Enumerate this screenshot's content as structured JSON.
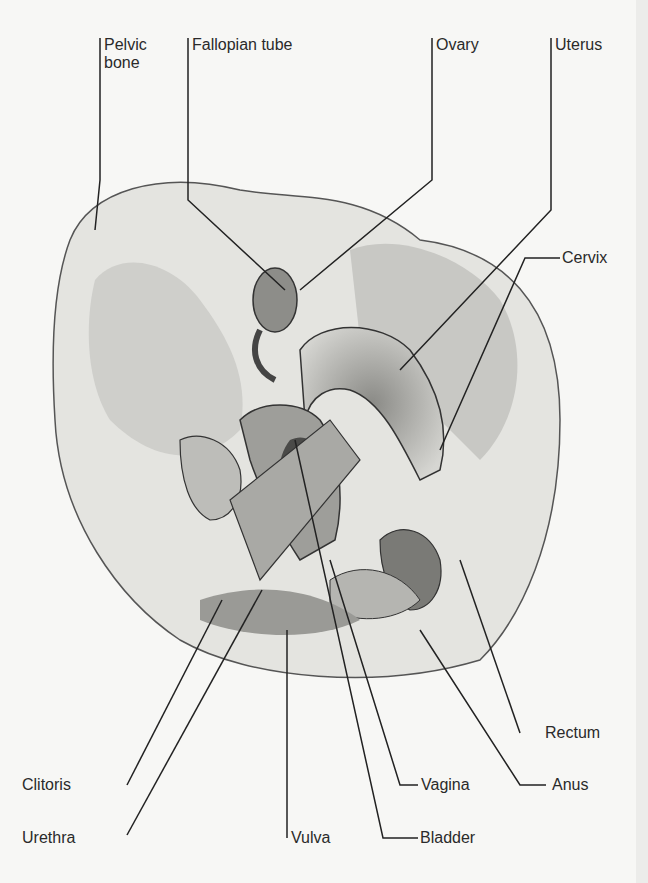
{
  "diagram": {
    "labels": {
      "pelvic_bone": "Pelvic\nbone",
      "fallopian_tube": "Fallopian tube",
      "ovary": "Ovary",
      "uterus": "Uterus",
      "cervix": "Cervix",
      "rectum": "Rectum",
      "clitoris": "Clitoris",
      "vagina": "Vagina",
      "anus": "Anus",
      "urethra": "Urethra",
      "vulva": "Vulva",
      "bladder": "Bladder"
    }
  }
}
